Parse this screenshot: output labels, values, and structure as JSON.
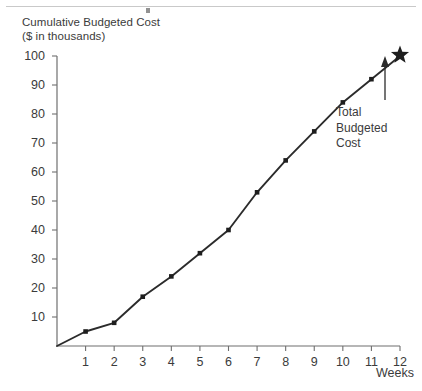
{
  "figure": {
    "y_axis_title": "Cumulative Budgeted Cost\n($ in thousands)",
    "x_axis_title": "Weeks",
    "annotation_label": "Total\nBudgeted\nCost",
    "line_color": "#2b2b2b",
    "text_color": "#3b3b3b",
    "marker_color": "#1e1e1e",
    "axis_color": "#6f6f6f",
    "background_color": "#ffffff"
  },
  "chart_data": {
    "type": "line",
    "title": "",
    "subtitle": "",
    "xlabel": "Weeks",
    "ylabel": "Cumulative Budgeted Cost ($ in thousands)",
    "x": [
      0,
      1,
      2,
      3,
      4,
      5,
      6,
      7,
      8,
      9,
      10,
      11,
      12
    ],
    "values": [
      0,
      5,
      8,
      17,
      24,
      32,
      40,
      53,
      64,
      74,
      84,
      92,
      100
    ],
    "series": [
      {
        "name": "Cumulative Budgeted Cost",
        "values": [
          0,
          5,
          8,
          17,
          24,
          32,
          40,
          53,
          64,
          74,
          84,
          92,
          100
        ]
      }
    ],
    "xlim": [
      0,
      12
    ],
    "ylim": [
      0,
      100
    ],
    "xticks": [
      1,
      2,
      3,
      4,
      5,
      6,
      7,
      8,
      9,
      10,
      11,
      12
    ],
    "xtick_labels": [
      "1",
      "2",
      "3",
      "4",
      "5",
      "6",
      "7",
      "8",
      "9",
      "10",
      "11",
      "12"
    ],
    "yticks": [
      10,
      20,
      30,
      40,
      50,
      60,
      70,
      80,
      90,
      100
    ],
    "ytick_labels": [
      "10",
      "20",
      "30",
      "40",
      "50",
      "60",
      "70",
      "80",
      "90",
      "100"
    ],
    "grid": false,
    "legend": "none",
    "markers": "square",
    "annotations": [
      {
        "text": "Total Budgeted Cost",
        "target_x": 12,
        "target_y": 100,
        "marker": "star",
        "arrow": "up"
      }
    ]
  }
}
